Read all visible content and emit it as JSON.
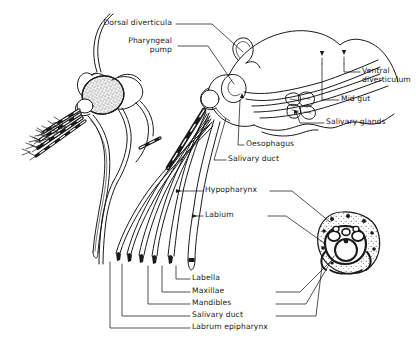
{
  "figure": {
    "title_implicit": "Mosquito head and mouthparts anatomy",
    "background": "#ffffff",
    "ink": "#1a1a1a"
  },
  "labels": [
    {
      "id": "dorsal-diverticula",
      "text": "Dorsal diverticula",
      "x": 172,
      "y": 22,
      "align": "right"
    },
    {
      "id": "pharyngeal-pump",
      "text": "Pharyngeal",
      "x": 172,
      "y": 40,
      "align": "right"
    },
    {
      "id": "pharyngeal-pump-2",
      "text": "pump",
      "x": 172,
      "y": 49,
      "align": "right"
    },
    {
      "id": "ventral-diverticulum",
      "text": "Ventral",
      "x": 362,
      "y": 70,
      "align": "left"
    },
    {
      "id": "ventral-diverticulum-2",
      "text": "diverticulum",
      "x": 362,
      "y": 79,
      "align": "left"
    },
    {
      "id": "mid-gut",
      "text": "Mid gut",
      "x": 341,
      "y": 98,
      "align": "left"
    },
    {
      "id": "salivary-glands",
      "text": "Salivary glands",
      "x": 326,
      "y": 121,
      "align": "left"
    },
    {
      "id": "oesophagus",
      "text": "Oesophagus",
      "x": 246,
      "y": 143,
      "align": "left"
    },
    {
      "id": "salivary-duct-upper",
      "text": "Salivary duct",
      "x": 228,
      "y": 158,
      "align": "left"
    },
    {
      "id": "hypopharynx",
      "text": "Hypopharynx",
      "x": 205,
      "y": 189,
      "align": "left"
    },
    {
      "id": "labium",
      "text": "Labium",
      "x": 205,
      "y": 214,
      "align": "left"
    },
    {
      "id": "labella",
      "text": "Labella",
      "x": 192,
      "y": 277,
      "align": "left"
    },
    {
      "id": "maxillae",
      "text": "Maxillae",
      "x": 192,
      "y": 290,
      "align": "left"
    },
    {
      "id": "mandibles",
      "text": "Mandibles",
      "x": 192,
      "y": 302,
      "align": "left"
    },
    {
      "id": "salivary-duct-lower",
      "text": "Salivary duct",
      "x": 192,
      "y": 314,
      "align": "left"
    },
    {
      "id": "labrum-epipharynx",
      "text": "Labrum epipharynx",
      "x": 192,
      "y": 326,
      "align": "left"
    }
  ],
  "parts": {
    "head_region": "mosquito head with stippled compound eye, antenna, banded maxillary palps and proboscis",
    "internal_region": "sagittal section showing pharyngeal pump, dorsal diverticula, oesophagus, mid gut, salivary glands",
    "fascicle_region": "splayed stylet bundle: labrum epipharynx, hypopharynx, mandibles, maxillae, labium with labella",
    "cross_section": "transverse section of proboscis, stippled labium enclosing stylets"
  }
}
